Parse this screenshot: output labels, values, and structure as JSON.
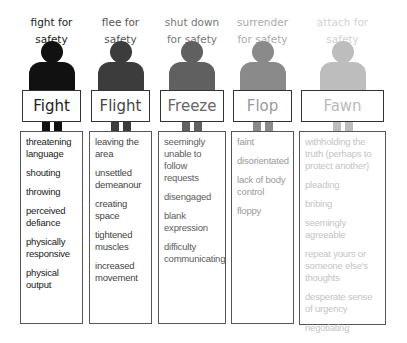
{
  "diagram": {
    "columns": [
      {
        "caption": "fight for safety",
        "caption_lines": [
          "fight for",
          "safety"
        ],
        "title": "Fight",
        "color": "#111111",
        "text_color": "#1a1a1a",
        "items": [
          "threatening language",
          "shouting",
          "throwing",
          "perceived defiance",
          "physically responsive",
          "physical output"
        ]
      },
      {
        "caption": "flee for safety",
        "caption_lines": [
          "flee for",
          "safety"
        ],
        "title": "Flight",
        "color": "#3c3c3c",
        "text_color": "#444444",
        "items": [
          "leaving the area",
          "unsettled demeanour",
          "creating space",
          "tightened muscles",
          "increased movement"
        ]
      },
      {
        "caption": "shut down for safety",
        "caption_lines": [
          "shut down",
          "for safety"
        ],
        "title": "Freeze",
        "color": "#606060",
        "text_color": "#5c5c5c",
        "items": [
          "seemingly unable to follow requests",
          "disengaged",
          "blank expression",
          "difficulty communicating"
        ]
      },
      {
        "caption": "surrender for safety",
        "caption_lines": [
          "surrender",
          "for safety"
        ],
        "title": "Flop",
        "color": "#8a8a8a",
        "text_color": "#8c8c8c",
        "items": [
          "faint",
          "disorientated",
          "lack of body control",
          "floppy"
        ]
      },
      {
        "caption": "attach for safety",
        "caption_lines": [
          "attach for",
          "safety"
        ],
        "title": "Fawn",
        "color": "#bdbdbd",
        "text_color": "#b5b5b5",
        "items": [
          "withholding the truth (perhaps to protect another)",
          "pleading",
          "bribing",
          "seemingly agreeable",
          "repeat yours or someone else's thoughts",
          "desperate sense of urgency",
          "negotiating"
        ]
      }
    ]
  }
}
